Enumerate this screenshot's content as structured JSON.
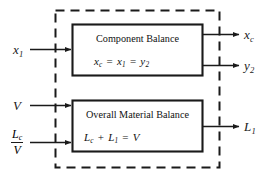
{
  "diagram": {
    "type": "block-diagram",
    "system_boundary": {
      "style": "dashed",
      "color": "#1a1a1a"
    },
    "blocks": [
      {
        "id": "component-balance",
        "title": "Component Balance",
        "equation_parts": [
          "x",
          "c",
          " = ",
          "x",
          "1",
          " = ",
          "y",
          "2"
        ],
        "equation_plain": "x_c = x_1 = y_2"
      },
      {
        "id": "overall-material-balance",
        "title": "Overall Material Balance",
        "equation_parts": [
          "L",
          "c",
          " + ",
          "L",
          "1",
          " = ",
          "V"
        ],
        "equation_plain": "L_c + L_1 = V"
      }
    ],
    "inputs": [
      {
        "id": "input-x1",
        "base": "x",
        "sub": "1",
        "kind": "simple"
      },
      {
        "id": "input-V",
        "base": "V",
        "sub": "",
        "kind": "simple"
      },
      {
        "id": "input-Lc-over-V",
        "numerator_base": "L",
        "numerator_sub": "c",
        "denominator": "V",
        "kind": "fraction"
      }
    ],
    "outputs": [
      {
        "id": "output-xc",
        "base": "x",
        "sub": "c"
      },
      {
        "id": "output-y2",
        "base": "y",
        "sub": "2"
      },
      {
        "id": "output-L1",
        "base": "L",
        "sub": "1"
      }
    ],
    "colors": {
      "line": "#1a1a1a",
      "text": "#111111",
      "background": "#ffffff"
    }
  }
}
